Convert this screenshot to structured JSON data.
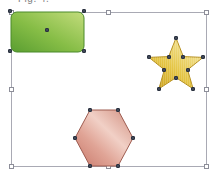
{
  "canvas": {
    "width": 217,
    "height": 179,
    "background_color": "#ffffff",
    "caption_fragment": "Fig. 4.",
    "caption_visible": false
  },
  "selection": {
    "frame_label": "group-selection-frame",
    "border_color": "#a9aab4",
    "handle_fill": "#ffffff",
    "handle_border": "#8d8e99",
    "x": 11,
    "y": 12,
    "width": 196,
    "height": 155,
    "handles": [
      {
        "name": "handle-top-left",
        "position": "top-left"
      },
      {
        "name": "handle-top-middle",
        "position": "top-middle"
      },
      {
        "name": "handle-top-right",
        "position": "top-right"
      },
      {
        "name": "handle-middle-left",
        "position": "middle-left"
      },
      {
        "name": "handle-middle-right",
        "position": "middle-right"
      },
      {
        "name": "handle-bottom-left",
        "position": "bottom-left"
      },
      {
        "name": "handle-bottom-middle",
        "position": "bottom-middle"
      },
      {
        "name": "handle-bottom-right",
        "position": "bottom-right"
      }
    ]
  },
  "shapes": [
    {
      "id": "rectangle",
      "label": "rounded-rectangle",
      "type": "rounded-rect",
      "x": 10,
      "y": 11,
      "width": 75,
      "height": 42,
      "corner_radius": 6,
      "fill_type": "gradient",
      "gradient_from": "#5a9e31",
      "gradient_mid": "#86bd46",
      "gradient_to": "#c3dc7c",
      "stroke": "#4a8a2b",
      "selected": true,
      "handle_count": 5
    },
    {
      "id": "star",
      "label": "five-point-star",
      "type": "star",
      "points": 5,
      "x": 147,
      "y": 36,
      "width": 58,
      "height": 58,
      "fill_type": "gradient",
      "gradient_from": "#d3a922",
      "gradient_mid": "#e9cd55",
      "gradient_to": "#f2e293",
      "stroke": "#b58e1c",
      "selected": true,
      "handle_count": 10
    },
    {
      "id": "hexagon",
      "label": "hexagon",
      "type": "hexagon",
      "x": 73,
      "y": 108,
      "width": 62,
      "height": 60,
      "fill_type": "gradient",
      "gradient_from": "#c8786a",
      "gradient_mid": "#e9b3a6",
      "gradient_to": "#f3d5cc",
      "stroke": "#9e5c50",
      "selected": true,
      "handle_count": 6
    }
  ]
}
